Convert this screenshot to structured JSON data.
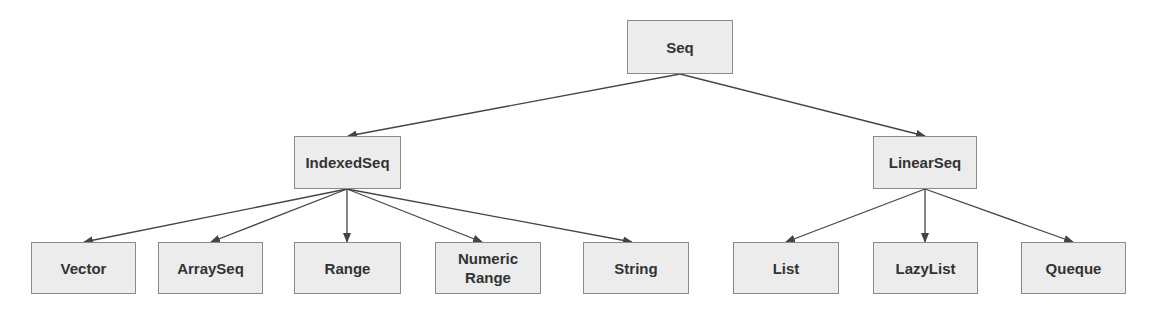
{
  "diagram": {
    "type": "hierarchy-tree",
    "colors": {
      "node_fill": "#ececec",
      "node_border": "#8a8a8a",
      "edge": "#444444",
      "text": "#333333"
    },
    "nodes": {
      "seq": {
        "label": "Seq",
        "box": [
          627,
          20,
          106,
          54
        ]
      },
      "indexedseq": {
        "label": "IndexedSeq",
        "box": [
          294,
          136,
          107,
          53
        ]
      },
      "linearseq": {
        "label": "LinearSeq",
        "box": [
          873,
          136,
          104,
          53
        ]
      },
      "vector": {
        "label": "Vector",
        "box": [
          31,
          242,
          105,
          52
        ]
      },
      "arrayseq": {
        "label": "ArraySeq",
        "box": [
          158,
          242,
          105,
          52
        ]
      },
      "range": {
        "label": "Range",
        "box": [
          294,
          242,
          107,
          52
        ]
      },
      "numericrange": {
        "label": "Numeric Range",
        "line1": "Numeric",
        "line2": "Range",
        "box": [
          435,
          242,
          106,
          52
        ]
      },
      "string": {
        "label": "String",
        "box": [
          583,
          242,
          106,
          52
        ]
      },
      "list": {
        "label": "List",
        "box": [
          733,
          242,
          106,
          52
        ]
      },
      "lazylist": {
        "label": "LazyList",
        "box": [
          873,
          242,
          105,
          52
        ]
      },
      "queque": {
        "label": "Queque",
        "box": [
          1021,
          242,
          105,
          52
        ]
      }
    },
    "edges": [
      {
        "from": "Seq",
        "to": "IndexedSeq"
      },
      {
        "from": "Seq",
        "to": "LinearSeq"
      },
      {
        "from": "IndexedSeq",
        "to": "Vector"
      },
      {
        "from": "IndexedSeq",
        "to": "ArraySeq"
      },
      {
        "from": "IndexedSeq",
        "to": "Range"
      },
      {
        "from": "IndexedSeq",
        "to": "Numeric Range"
      },
      {
        "from": "IndexedSeq",
        "to": "String"
      },
      {
        "from": "LinearSeq",
        "to": "List"
      },
      {
        "from": "LinearSeq",
        "to": "LazyList"
      },
      {
        "from": "LinearSeq",
        "to": "Queque"
      }
    ]
  }
}
